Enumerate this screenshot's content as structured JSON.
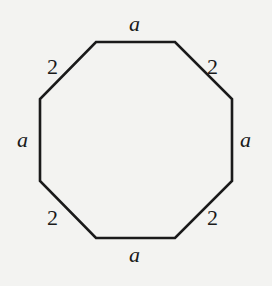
{
  "diagram": {
    "type": "octagon",
    "stroke_color": "#1a1a1a",
    "background": "#f3f3f1",
    "vertices": [
      [
        96,
        42
      ],
      [
        175,
        42
      ],
      [
        232,
        99
      ],
      [
        232,
        181
      ],
      [
        175,
        238
      ],
      [
        96,
        238
      ],
      [
        40,
        181
      ],
      [
        40,
        99
      ]
    ],
    "labels": {
      "top": "a",
      "top_right": "2",
      "right": "a",
      "bottom_right": "2",
      "bottom": "a",
      "bottom_left": "2",
      "left": "a",
      "top_left": "2"
    }
  }
}
